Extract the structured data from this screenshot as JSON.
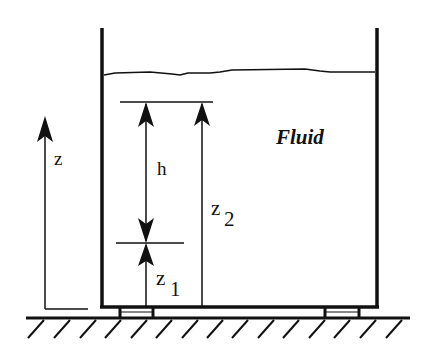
{
  "diagram": {
    "labels": {
      "fluid": "Fluid",
      "z_axis": "z",
      "h": "h",
      "z1_base": "z",
      "z1_sub": "1",
      "z2_base": "z",
      "z2_sub": "2"
    },
    "colors": {
      "line": "#111111",
      "background": "#ffffff"
    },
    "elements": [
      "tank-left-wall",
      "tank-right-wall",
      "tank-bottom",
      "fluid-free-surface",
      "z-axis-arrow",
      "h-dimension-arrow",
      "z1-dimension-arrow",
      "z2-dimension-arrow",
      "reference-line-upper",
      "reference-line-lower",
      "ground-with-hatching",
      "tank-supports"
    ]
  }
}
